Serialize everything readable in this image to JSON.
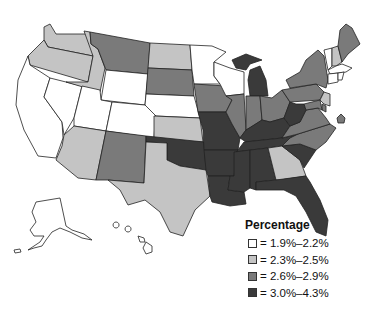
{
  "legend": {
    "title": "Percentage",
    "items": [
      {
        "label": "= 1.9%–2.2%",
        "color": "#ffffff"
      },
      {
        "label": "= 2.3%–2.5%",
        "color": "#c4c4c4"
      },
      {
        "label": "= 2.6%–2.9%",
        "color": "#7a7a7a"
      },
      {
        "label": "= 3.0%–4.3%",
        "color": "#3a3a3a"
      }
    ]
  },
  "map": {
    "title_fragment": "",
    "states": {
      "WA": 1,
      "OR": 1,
      "CA": 0,
      "NV": 0,
      "ID": 1,
      "MT": 2,
      "WY": 0,
      "UT": 0,
      "AZ": 1,
      "CO": 0,
      "NM": 2,
      "ND": 1,
      "SD": 2,
      "NE": 0,
      "KS": 1,
      "OK": 3,
      "TX": 1,
      "MN": 0,
      "IA": 2,
      "MO": 3,
      "AR": 3,
      "LA": 3,
      "WI": 0,
      "IL": 2,
      "MI": 3,
      "IN": 2,
      "OH": 2,
      "KY": 3,
      "TN": 3,
      "MS": 3,
      "AL": 3,
      "GA": 1,
      "FL": 3,
      "SC": 3,
      "NC": 2,
      "VA": 2,
      "WV": 3,
      "PA": 2,
      "NY": 2,
      "ME": 2,
      "NH": 1,
      "VT": 0,
      "MA": 0,
      "CT": 0,
      "RI": 0,
      "NJ": 1,
      "DE": 2,
      "MD": 2,
      "DC": 2,
      "AK": 0,
      "HI": 0
    }
  }
}
